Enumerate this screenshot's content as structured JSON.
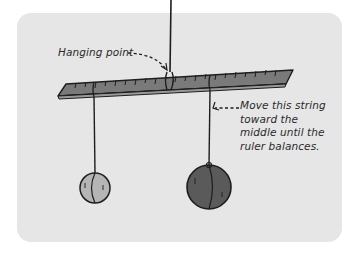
{
  "figure": {
    "labels": {
      "hanging_point": "Hanging point",
      "instruction_lines": [
        "Move this string",
        "toward the",
        "middle until the",
        "ruler balances."
      ]
    },
    "elements": {
      "ruler": "ruler with tick marks, tilted",
      "light_ball": "small light weight",
      "heavy_ball": "large heavy weight"
    },
    "colors": {
      "background": "#e6e6e6",
      "ruler_fill": "#7a7a7a",
      "light_ball_fill": "#b5b5b5",
      "heavy_ball_fill": "#5a5a5a",
      "line": "#1e1e1e"
    }
  }
}
